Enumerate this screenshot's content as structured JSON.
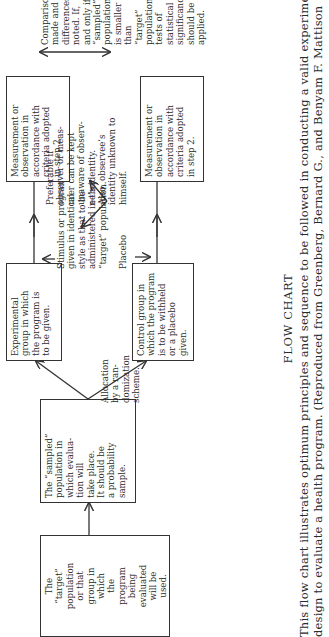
{
  "flowchart": {
    "target_population": "The\n“target”\npopulation\nor that\ngroup in\nwhich\nthe\nprogram\nbeing\nevaluated\nwill be\nused.",
    "sampled_population": "The “sampled”\npopulation in\nwhich evalua-\ntion will\ntake place.\nIt should be\na probability\nsample.",
    "allocation_note": "Allocation\nby a ran-\ndomization\nscheme.",
    "experimental_group": "Experimental\ngroup in which\nthe program is\nto be given.",
    "control_group": "Control group in\nwhich the program\nis to be withheld\nor a placebo\ngiven.",
    "stimulus_note": "Stimulus or program\ngiven in identical\nstyle as that to be\nadministered in the\n“target” population.",
    "placebo_note": "Placebo",
    "measurement_top": "Measurement or\nobservation in\naccordance with\ncriteria adopted\nin step 2.",
    "measurement_bottom": "Measurement or\nobservation in\naccordance with\ncriteria adopted\nin step 2.",
    "observer_note": "Preferable if\nobserver or meas-\nurer can be kept\nunaware of observ-\nee’s identity.\nAlso, observee’s\nidentity unknown to\nhimself.",
    "comparison_note": "Comparisons\nmade and\ndifferences\nnoted. If,\nand only if,\n“sampled”\npopulation\nis smaller\nthan “target”\npopulation,\ntests of\nstatistical\nsignificance\nshould be\napplied."
  },
  "caption": {
    "title": "FLOW CHART",
    "text": "This flow chart illustrates optimum principles and sequence to be followed in conducting a valid experimental\ndesign to evaluate a health program. (Reproduced from Greenberg, Bernard G., and Benyam F. Mattison"
  }
}
